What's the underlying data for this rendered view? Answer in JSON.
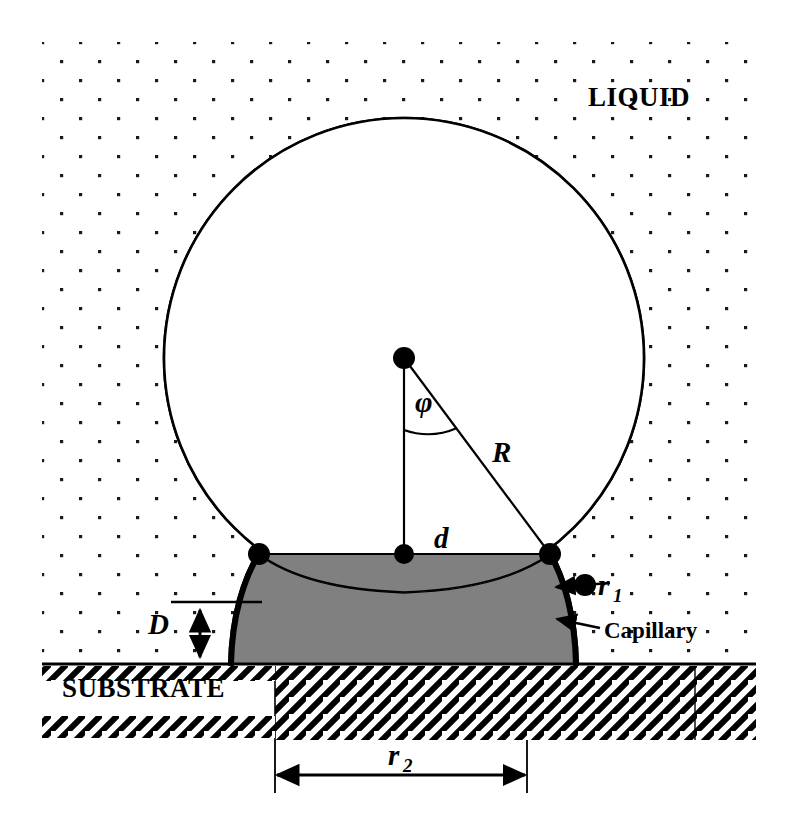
{
  "figure": {
    "type": "scientific-schematic"
  },
  "regions": {
    "liquid_label": "LIQUID",
    "substrate_label": "SUBSTRATE"
  },
  "annotations": {
    "angle_phi": "φ",
    "radius_R": "R",
    "distance_d": "d",
    "gap_D": "D",
    "meniscus_r1": "r",
    "meniscus_r1_sub": "1",
    "contact_r2": "r",
    "contact_r2_sub": "2",
    "capillary_label": "Capillary"
  },
  "colors": {
    "background": "#ffffff",
    "outline": "#000000",
    "bridge_fill": "#808080",
    "liquid_dot": "#1a1a1a",
    "substrate_hatch": "#000000"
  },
  "geometry": {
    "sphere_center_x": 404,
    "sphere_center_y": 358,
    "sphere_radius": 240,
    "contact_left_x": 259,
    "contact_right_x": 550,
    "contact_y": 554,
    "substrate_top_y": 665,
    "bridge_left_x": 275,
    "bridge_right_x": 527,
    "r2_arrow_y": 790,
    "liquid_left": 42,
    "liquid_top": 42,
    "liquid_right": 756,
    "liquid_bottom": 662
  }
}
